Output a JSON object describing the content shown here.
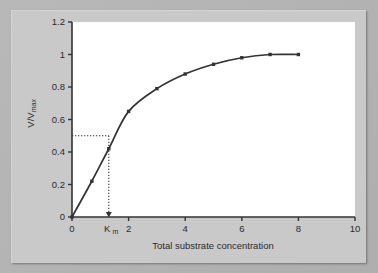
{
  "figure": {
    "background_color": "#b3b3b3",
    "panel_color": "#c9c9c9",
    "plot_area_color": "#ffffff",
    "line_color": "#333333"
  },
  "chart_data": {
    "type": "line",
    "title": "",
    "subtitle": "",
    "xlabel": "Total substrate concentration",
    "ylabel": "V/Vmax",
    "ylabel_main": "V/V",
    "ylabel_sub": "max",
    "xlim": [
      0,
      10
    ],
    "ylim": [
      0,
      1.2
    ],
    "grid": false,
    "legend": null,
    "x_ticks": [
      0,
      2,
      4,
      6,
      8,
      10
    ],
    "x_tick_labels": [
      "0",
      "2",
      "4",
      "6",
      "8",
      "10"
    ],
    "y_ticks": [
      0,
      0.2,
      0.4,
      0.6,
      0.8,
      1,
      1.2
    ],
    "y_tick_labels": [
      "0",
      "0.2",
      "0.4",
      "0.6",
      "0.8",
      "1",
      "1.2"
    ],
    "x": [
      0,
      0.7,
      1.3,
      2,
      3,
      4,
      5,
      6,
      7,
      8
    ],
    "values": [
      0,
      0.22,
      0.42,
      0.65,
      0.79,
      0.88,
      0.94,
      0.98,
      1.0,
      1.0
    ],
    "series": [
      {
        "name": "Michaelis-Menten saturation",
        "x": [
          0,
          0.7,
          1.3,
          2,
          3,
          4,
          5,
          6,
          7,
          8
        ],
        "values": [
          0,
          0.22,
          0.42,
          0.65,
          0.79,
          0.88,
          0.94,
          0.98,
          1.0,
          1.0
        ],
        "marker": "square",
        "color": "#333333"
      }
    ],
    "annotations": [
      {
        "name": "half-vmax-guide",
        "type": "dotted-horizontal",
        "y": 0.5,
        "x_from": 0,
        "x_to": 1.3
      },
      {
        "name": "km-guide",
        "type": "dotted-vertical-arrow",
        "x": 1.3,
        "y_from": 0.5,
        "y_to": 0
      },
      {
        "name": "km-axis-label",
        "type": "x-tick-label",
        "x": 1.3,
        "label_main": "K",
        "label_sub": "m"
      }
    ]
  }
}
